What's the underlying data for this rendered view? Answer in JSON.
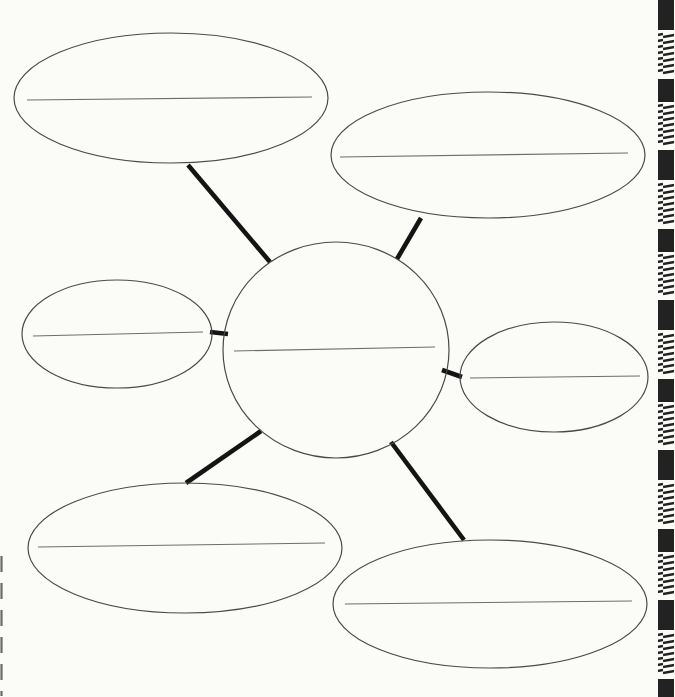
{
  "colors": {
    "paper": "#fbfbf8",
    "outline": "#4a4a4a",
    "write_line": "#6e6e6e",
    "connector": "#141414",
    "edge_pattern": "#222222"
  },
  "diagram": {
    "nodes": [
      {
        "id": "center",
        "shape": "circle",
        "position": "center",
        "label": "",
        "has_write_line": true
      },
      {
        "id": "top-left",
        "shape": "ellipse",
        "position": "top-left",
        "label": "",
        "has_write_line": true
      },
      {
        "id": "top-right",
        "shape": "ellipse",
        "position": "top-right",
        "label": "",
        "has_write_line": true
      },
      {
        "id": "middle-left",
        "shape": "ellipse",
        "position": "middle-left",
        "label": "",
        "has_write_line": true
      },
      {
        "id": "middle-right",
        "shape": "ellipse",
        "position": "middle-right",
        "label": "",
        "has_write_line": true
      },
      {
        "id": "bottom-left",
        "shape": "ellipse",
        "position": "bottom-left",
        "label": "",
        "has_write_line": true
      },
      {
        "id": "bottom-right",
        "shape": "ellipse",
        "position": "bottom-right",
        "label": "",
        "has_write_line": true
      }
    ],
    "edges": [
      {
        "from": "center",
        "to": "top-left"
      },
      {
        "from": "center",
        "to": "top-right"
      },
      {
        "from": "center",
        "to": "middle-left"
      },
      {
        "from": "center",
        "to": "middle-right"
      },
      {
        "from": "center",
        "to": "bottom-left"
      },
      {
        "from": "center",
        "to": "bottom-right"
      }
    ]
  }
}
